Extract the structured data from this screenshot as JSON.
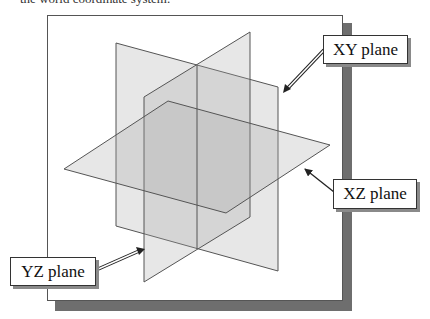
{
  "caption": "the world coordinate system.",
  "figure": {
    "planes": [
      {
        "name": "XY plane",
        "label": "XY plane"
      },
      {
        "name": "XZ plane",
        "label": "XZ plane"
      },
      {
        "name": "YZ plane",
        "label": "YZ plane"
      }
    ]
  },
  "labels": {
    "xy": "XY plane",
    "xz": "XZ plane",
    "yz": "YZ plane"
  },
  "colors": {
    "plane_fill": "#d8d8d8",
    "plane_edge": "#555555",
    "panel_shadow": "#6e6e6e"
  }
}
